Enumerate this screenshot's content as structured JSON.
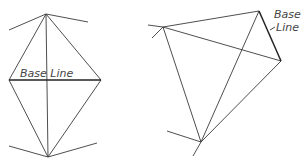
{
  "diagrams": [
    {
      "id": "left",
      "label": "Base Line",
      "vertices": {
        "top": [
          46,
          14
        ],
        "left": [
          9,
          80
        ],
        "right": [
          101,
          80
        ],
        "bottom": [
          48,
          157
        ]
      },
      "base_line": "left-right"
    },
    {
      "id": "right",
      "label_line1": "Base",
      "label_line2": "Line",
      "vertices": {
        "a": [
          163,
          27
        ],
        "b": [
          259,
          11
        ],
        "c": [
          281,
          61
        ],
        "d": [
          201,
          142
        ]
      },
      "base_line": "b-c"
    }
  ]
}
